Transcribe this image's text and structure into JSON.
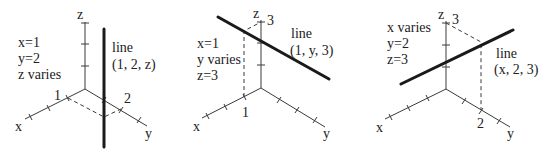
{
  "panels": [
    {
      "axes": {
        "x": "x",
        "y": "y",
        "z": "z"
      },
      "conditions": [
        "x=1",
        "y=2",
        "z varies"
      ],
      "line_title": "line",
      "line_eq": "(1, 2, z)",
      "tick_labels": {
        "x": "1",
        "y": "2"
      }
    },
    {
      "axes": {
        "x": "x",
        "y": "y",
        "z": "z"
      },
      "conditions": [
        "x=1",
        "y varies",
        "z=3"
      ],
      "line_title": "line",
      "line_eq": "(1, y, 3)",
      "tick_labels": {
        "x": "1",
        "z": "3"
      }
    },
    {
      "axes": {
        "x": "x",
        "y": "y",
        "z": "z"
      },
      "conditions": [
        "x varies",
        "y=2",
        "z=3"
      ],
      "line_title": "line",
      "line_eq": "(x, 2, 3)",
      "tick_labels": {
        "y": "2",
        "z": "3"
      }
    }
  ]
}
